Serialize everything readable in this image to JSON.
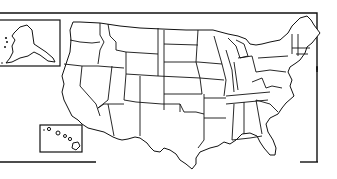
{
  "map": {
    "title": "United States outline map",
    "style": "black line art on white",
    "colors": {
      "line": "#111111",
      "background": "#ffffff"
    },
    "insets": [
      {
        "name": "Alaska",
        "position": "top-left"
      },
      {
        "name": "Hawaii",
        "position": "bottom-left"
      }
    ],
    "labels": []
  }
}
